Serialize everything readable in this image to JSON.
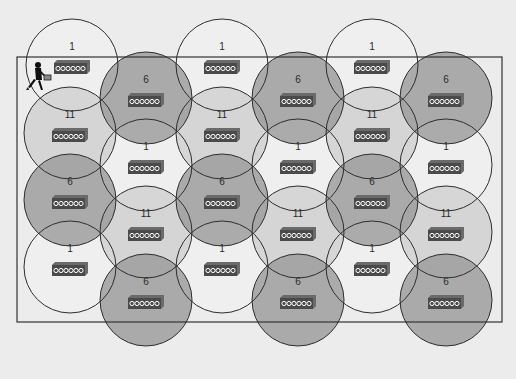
{
  "diagram": {
    "title": "",
    "colors": {
      "background": "#ececec",
      "floor_outline": "#333333",
      "channel_1_fill": "#f2f2f2",
      "channel_6_fill": "#9a9a9a",
      "channel_11_fill": "#cfcfcf",
      "circle_stroke": "#2e2e2e",
      "ap_body": "#4a4a4a",
      "ap_top": "#6a6a6a",
      "ap_glyph": "#ffffff"
    },
    "floor": {
      "x": 17,
      "y": 57,
      "width": 485,
      "height": 265
    },
    "radius": 46,
    "cells": [
      {
        "id": "c1r1",
        "channel": "1",
        "cx": 72,
        "cy": 65
      },
      {
        "id": "c1r2",
        "channel": "11",
        "cx": 70,
        "cy": 133
      },
      {
        "id": "c1r3",
        "channel": "6",
        "cx": 70,
        "cy": 200
      },
      {
        "id": "c1r4",
        "channel": "1",
        "cx": 70,
        "cy": 267
      },
      {
        "id": "c2r1",
        "channel": "6",
        "cx": 146,
        "cy": 98
      },
      {
        "id": "c2r2",
        "channel": "1",
        "cx": 146,
        "cy": 165
      },
      {
        "id": "c2r3",
        "channel": "11",
        "cx": 146,
        "cy": 232
      },
      {
        "id": "c2r4",
        "channel": "6",
        "cx": 146,
        "cy": 300
      },
      {
        "id": "c3r1",
        "channel": "1",
        "cx": 222,
        "cy": 65
      },
      {
        "id": "c3r2",
        "channel": "11",
        "cx": 222,
        "cy": 133
      },
      {
        "id": "c3r3",
        "channel": "6",
        "cx": 222,
        "cy": 200
      },
      {
        "id": "c3r4",
        "channel": "1",
        "cx": 222,
        "cy": 267
      },
      {
        "id": "c4r1",
        "channel": "6",
        "cx": 298,
        "cy": 98
      },
      {
        "id": "c4r2",
        "channel": "1",
        "cx": 298,
        "cy": 165
      },
      {
        "id": "c4r3",
        "channel": "11",
        "cx": 298,
        "cy": 232
      },
      {
        "id": "c4r4",
        "channel": "6",
        "cx": 298,
        "cy": 300
      },
      {
        "id": "c5r1",
        "channel": "1",
        "cx": 372,
        "cy": 65
      },
      {
        "id": "c5r2",
        "channel": "11",
        "cx": 372,
        "cy": 133
      },
      {
        "id": "c5r3",
        "channel": "6",
        "cx": 372,
        "cy": 200
      },
      {
        "id": "c5r4",
        "channel": "1",
        "cx": 372,
        "cy": 267
      },
      {
        "id": "c6r1",
        "channel": "6",
        "cx": 446,
        "cy": 98
      },
      {
        "id": "c6r2",
        "channel": "1",
        "cx": 446,
        "cy": 165
      },
      {
        "id": "c6r3",
        "channel": "11",
        "cx": 446,
        "cy": 232
      },
      {
        "id": "c6r4",
        "channel": "6",
        "cx": 446,
        "cy": 300
      }
    ],
    "user": {
      "icon": "walking-user-with-laptop-icon",
      "x": 38,
      "y": 78
    }
  }
}
